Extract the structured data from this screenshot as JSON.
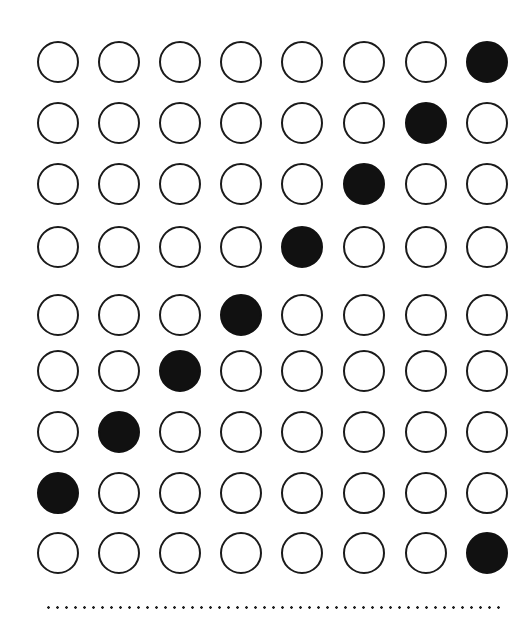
{
  "grid": {
    "rows": 9,
    "cols": 8,
    "col_centers": [
      58,
      119,
      180,
      241,
      302,
      364,
      426,
      487
    ],
    "row_centers": [
      62,
      123,
      184,
      247,
      315,
      371,
      432,
      493,
      553
    ],
    "diameter": 42,
    "filled": [
      [
        0,
        0,
        0,
        0,
        0,
        0,
        0,
        1
      ],
      [
        0,
        0,
        0,
        0,
        0,
        0,
        1,
        0
      ],
      [
        0,
        0,
        0,
        0,
        0,
        1,
        0,
        0
      ],
      [
        0,
        0,
        0,
        0,
        1,
        0,
        0,
        0
      ],
      [
        0,
        0,
        0,
        1,
        0,
        0,
        0,
        0
      ],
      [
        0,
        0,
        1,
        0,
        0,
        0,
        0,
        0
      ],
      [
        0,
        1,
        0,
        0,
        0,
        0,
        0,
        0
      ],
      [
        1,
        0,
        0,
        0,
        0,
        0,
        0,
        0
      ],
      [
        0,
        0,
        0,
        0,
        0,
        0,
        0,
        1
      ]
    ]
  },
  "colors": {
    "filled": "#111111",
    "outline": "#1a1a1a",
    "background": "#ffffff"
  },
  "divider": {
    "style": "dotted",
    "y": 607
  }
}
